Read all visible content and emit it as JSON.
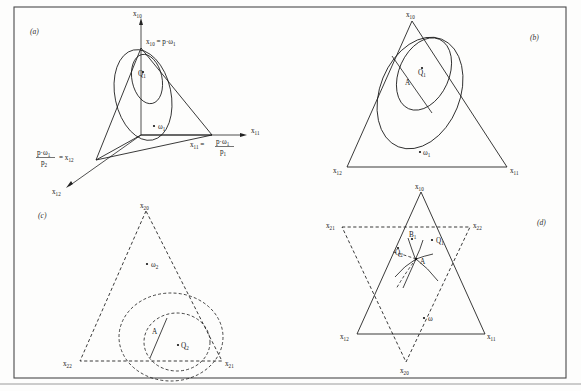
{
  "figure": {
    "background_color": "#fdfdfc",
    "ink_color": "#161616",
    "frame_color": "#4a4a4a"
  },
  "panels": [
    {
      "id": "a",
      "tag": "(a)",
      "description": "Three-dimensional axes with budget simplex and two indifference surfaces",
      "axes": [
        {
          "name": "axis-x10",
          "label": "x",
          "sub": "10"
        },
        {
          "name": "axis-x11",
          "label": "x",
          "sub": "11"
        },
        {
          "name": "axis-x12",
          "label": "x",
          "sub": "12"
        }
      ],
      "annotations": [
        {
          "name": "vertex-label-x10",
          "text": "x",
          "sub": "10",
          "eq": "= p·ω",
          "eqsub": "1"
        },
        {
          "name": "vertex-label-x11",
          "text": "x",
          "sub": "11",
          "eq": "=",
          "frac_num": "p·ω",
          "frac_num_sub": "1",
          "frac_den": "p",
          "frac_den_sub": "1"
        },
        {
          "name": "vertex-label-x12",
          "frac_num": "p·ω",
          "frac_num_sub": "1",
          "frac_den": "p",
          "frac_den_sub": "2",
          "eq": "=",
          "text": "x",
          "sub": "12"
        },
        {
          "name": "point-label-Q1",
          "text": "Q",
          "sub": "1"
        },
        {
          "name": "point-label-omega1",
          "text": "ω",
          "sub": "1"
        }
      ]
    },
    {
      "id": "b",
      "tag": "(b)",
      "description": "Planar budget simplex triangle with two nested indifference ellipses and tangent line",
      "vertices": [
        {
          "name": "vertex-x10",
          "text": "x",
          "sub": "10",
          "position": "top"
        },
        {
          "name": "vertex-x12",
          "text": "x",
          "sub": "12",
          "position": "bottom-left"
        },
        {
          "name": "vertex-x11",
          "text": "x",
          "sub": "11",
          "position": "bottom-right"
        }
      ],
      "annotations": [
        {
          "name": "point-label-Q1",
          "text": "Q",
          "sub": "1"
        },
        {
          "name": "point-label-A",
          "text": "A",
          "sub": ""
        },
        {
          "name": "point-label-omega1",
          "text": "ω",
          "sub": "1"
        }
      ]
    },
    {
      "id": "c",
      "tag": "(c)",
      "description": "Dashed budget simplex triangle with nested dashed indifference curves and tangent line",
      "vertices": [
        {
          "name": "vertex-x20",
          "text": "x",
          "sub": "20",
          "position": "top"
        },
        {
          "name": "vertex-x22",
          "text": "x",
          "sub": "22",
          "position": "bottom-left"
        },
        {
          "name": "vertex-x21",
          "text": "x",
          "sub": "21",
          "position": "bottom-right"
        }
      ],
      "annotations": [
        {
          "name": "point-label-Q2",
          "text": "Q",
          "sub": "2"
        },
        {
          "name": "point-label-A",
          "text": "A",
          "sub": ""
        },
        {
          "name": "point-label-omega2",
          "text": "ω",
          "sub": "2"
        }
      ]
    },
    {
      "id": "d",
      "tag": "(d)",
      "description": "Superimposed upright solid simplex and inverted dashed simplex forming a hexagram, with equilibrium point A",
      "vertices": [
        {
          "name": "vertex-x10",
          "text": "x",
          "sub": "10",
          "position": "top"
        },
        {
          "name": "vertex-x12",
          "text": "x",
          "sub": "12",
          "position": "lower-left"
        },
        {
          "name": "vertex-x11",
          "text": "x",
          "sub": "11",
          "position": "lower-right"
        },
        {
          "name": "vertex-x21",
          "text": "x",
          "sub": "21",
          "position": "upper-left"
        },
        {
          "name": "vertex-x22",
          "text": "x",
          "sub": "22",
          "position": "upper-right"
        },
        {
          "name": "vertex-x20",
          "text": "x",
          "sub": "20",
          "position": "bottom"
        }
      ],
      "annotations": [
        {
          "name": "point-label-Q1",
          "text": "Q",
          "sub": "1"
        },
        {
          "name": "point-label-Q2",
          "text": "Q",
          "sub": "2"
        },
        {
          "name": "point-label-B1",
          "text": "B",
          "sub": "1"
        },
        {
          "name": "point-label-A",
          "text": "A",
          "sub": ""
        },
        {
          "name": "point-label-omega",
          "text": "ω",
          "sub": ""
        }
      ]
    }
  ]
}
